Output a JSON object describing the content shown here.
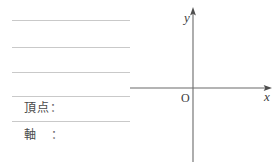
{
  "worksheet": {
    "answer_lines": [
      {
        "id": "blank-line-1",
        "top": 20,
        "left": 12,
        "width": 118
      },
      {
        "id": "blank-line-2",
        "top": 47,
        "left": 12,
        "width": 118
      },
      {
        "id": "blank-line-3",
        "top": 72,
        "left": 12,
        "width": 118
      },
      {
        "id": "blank-line-4",
        "top": 96,
        "left": 12,
        "width": 118
      },
      {
        "id": "blank-line-5",
        "top": 121,
        "left": 12,
        "width": 118
      }
    ],
    "fields": [
      {
        "id": "vertex",
        "label": "頂点",
        "colon": "：",
        "value": "",
        "top": 101,
        "left": 24
      },
      {
        "id": "axis",
        "label": "軸",
        "colon": "：",
        "value": "",
        "top": 128,
        "left": 24
      }
    ]
  },
  "graph": {
    "x_axis_label": "x",
    "y_axis_label": "y",
    "origin_label": "O",
    "axis_color": "#6b6b6b",
    "label_color": "#3c3c3c"
  },
  "chart_data": {
    "type": "line",
    "title": "",
    "xlabel": "x",
    "ylabel": "y",
    "series": [],
    "x": [],
    "values": [],
    "xlim": [
      -4.2,
      2.6
    ],
    "ylim": [
      -2.7,
      3.1
    ],
    "grid": false,
    "legend": "none",
    "annotations": [
      "O"
    ]
  }
}
